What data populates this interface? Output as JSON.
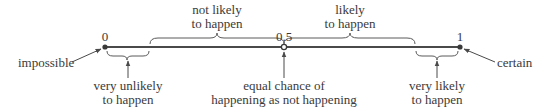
{
  "diagram": {
    "type": "probability-scale",
    "line_color": "#4a4a4a",
    "text_color": "#3a3a3a",
    "points": [
      {
        "value": "0",
        "x": 105
      },
      {
        "value": "0.5",
        "x": 284
      },
      {
        "value": "1",
        "x": 460
      }
    ],
    "upper_braces": [
      {
        "line1": "not likely",
        "line2": "to happen",
        "x1": 150,
        "x2": 284
      },
      {
        "line1": "likely",
        "line2": "to happen",
        "x1": 284,
        "x2": 415
      }
    ],
    "lower_braces": [
      {
        "line1": "very unlikely",
        "line2": "to happen",
        "x1": 105,
        "x2": 150
      },
      {
        "line1": "very likely",
        "line2": "to happen",
        "x1": 415,
        "x2": 460
      }
    ],
    "endpoint_labels": {
      "left": "impossible",
      "right": "certain"
    },
    "midpoint_label": {
      "line1": "equal chance of",
      "line2": "happening as not happening"
    }
  }
}
